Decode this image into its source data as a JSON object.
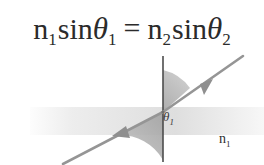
{
  "equation": {
    "n_left": "n",
    "n_left_sub": "1",
    "sin_left": "sin",
    "theta_left": "θ",
    "theta_left_sub": "1",
    "equals": "=",
    "n_right": "n",
    "n_right_sub": "2",
    "sin_right": "sin",
    "theta_right": "θ",
    "theta_right_sub": "2",
    "full_text": "n1sinθ1 = n2sinθ2"
  },
  "diagram": {
    "labels": {
      "medium_upper": "n",
      "medium_upper_sub": "1",
      "medium_lower": "n",
      "medium_lower_sub": "2",
      "angle_incident": "θ",
      "angle_incident_sub": "1",
      "angle_refracted": "θ",
      "angle_refracted_sub": "2"
    },
    "colors": {
      "text": "#2b2b2b",
      "ray": "#8c8c8c",
      "normal_line": "#4a4a4a",
      "wedge": "#b0b0b0",
      "interface_band": "#e2e2e2",
      "background": "#ffffff"
    },
    "geometry": {
      "origin_x": 163,
      "origin_y": 60,
      "normal_top_y": 4,
      "normal_bottom_y": 110,
      "interface_band_top_y": 55,
      "interface_band_height": 28,
      "incident_ray_angle_deg": 33,
      "refracted_ray_angle_deg": 62
    }
  }
}
